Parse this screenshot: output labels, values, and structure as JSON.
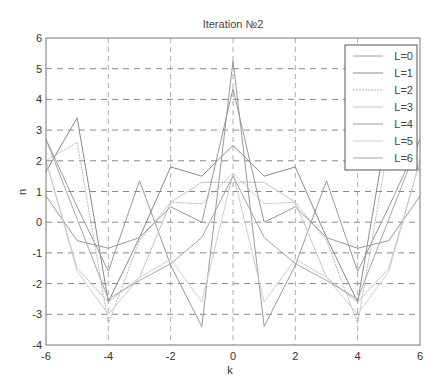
{
  "chart_data": {
    "type": "line",
    "title": "Iteration №2",
    "xlabel": "k",
    "ylabel": "n",
    "xlim": [
      -6,
      6
    ],
    "ylim": [
      -4,
      6
    ],
    "xticks": [
      -6,
      -4,
      -2,
      0,
      2,
      4,
      6
    ],
    "yticks": [
      -4,
      -3,
      -2,
      -1,
      0,
      1,
      2,
      3,
      4,
      5,
      6
    ],
    "grid": true,
    "legend_position": "top-right",
    "x": [
      -6,
      -5,
      -4,
      -3,
      -2,
      -1,
      0,
      1,
      2,
      3,
      4,
      5,
      6
    ],
    "series": [
      {
        "name": "L=0",
        "color": "#9a9a9a",
        "dash": "",
        "values": [
          2.7,
          0.5,
          -1.6,
          1.35,
          -1.4,
          -3.4,
          5.25,
          -3.4,
          -1.4,
          1.35,
          -1.6,
          0.5,
          2.7
        ]
      },
      {
        "name": "L=1",
        "color": "#8a8a8a",
        "dash": "",
        "values": [
          1.65,
          3.4,
          -2.6,
          -0.5,
          1.8,
          1.5,
          2.5,
          1.5,
          1.8,
          -0.5,
          -2.6,
          3.4,
          1.65
        ]
      },
      {
        "name": "L=2",
        "color": "#b8b8b8",
        "dash": "2,1",
        "values": [
          2.0,
          2.6,
          -3.3,
          -0.6,
          0.65,
          0.6,
          1.6,
          0.6,
          0.65,
          -0.6,
          -3.3,
          2.6,
          2.0
        ]
      },
      {
        "name": "L=3",
        "color": "#c4c4c4",
        "dash": "",
        "values": [
          2.0,
          -1.5,
          -2.6,
          -1.8,
          0.65,
          1.3,
          1.3,
          1.3,
          0.65,
          -1.8,
          -2.6,
          -1.5,
          2.0
        ]
      },
      {
        "name": "L=4",
        "color": "#999999",
        "dash": "",
        "values": [
          0.85,
          -0.6,
          -0.85,
          -0.5,
          0.5,
          0.0,
          4.35,
          0.0,
          0.5,
          -0.5,
          -0.85,
          -0.6,
          0.85
        ]
      },
      {
        "name": "L=5",
        "color": "#cfcfcf",
        "dash": "",
        "values": [
          2.0,
          -1.6,
          -3.0,
          -1.8,
          -1.2,
          -2.6,
          1.6,
          -2.6,
          -1.2,
          -1.8,
          -3.0,
          -1.6,
          2.0
        ]
      },
      {
        "name": "L=6",
        "color": "#a5a5a5",
        "dash": "",
        "values": [
          2.7,
          0.1,
          -2.5,
          -1.9,
          -1.35,
          -0.5,
          1.5,
          -0.5,
          -1.35,
          -1.9,
          -2.5,
          0.1,
          2.7
        ]
      }
    ]
  }
}
